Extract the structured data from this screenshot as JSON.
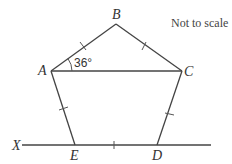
{
  "diagram": {
    "note": "Not to scale",
    "angle_label": "36°",
    "vertices": [
      {
        "name": "A",
        "x": 51,
        "y": 71
      },
      {
        "name": "B",
        "x": 116,
        "y": 24
      },
      {
        "name": "C",
        "x": 182,
        "y": 71
      },
      {
        "name": "D",
        "x": 157,
        "y": 145
      },
      {
        "name": "E",
        "x": 75,
        "y": 145
      }
    ],
    "line_label": "X",
    "labels": {
      "A": "A",
      "B": "B",
      "C": "C",
      "D": "D",
      "E": "E",
      "X": "X"
    }
  }
}
